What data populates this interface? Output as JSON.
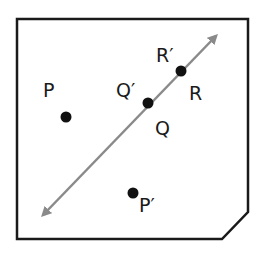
{
  "diagram": {
    "type": "reflection",
    "frame": {
      "stroke": "#1a1a1a"
    },
    "line": {
      "color": "#8a8a8a",
      "from": [
        37,
        221
      ],
      "to": [
        222,
        30
      ]
    },
    "points": [
      {
        "id": "P",
        "label": "P",
        "x": 66,
        "y": 117
      },
      {
        "id": "P_prime",
        "label": "P′",
        "x": 133,
        "y": 193
      },
      {
        "id": "Q",
        "label": "Q",
        "x": 148,
        "y": 103
      },
      {
        "id": "Q_prime",
        "label": "Q′",
        "x": 148,
        "y": 103
      },
      {
        "id": "R",
        "label": "R",
        "x": 181,
        "y": 71
      },
      {
        "id": "R_prime",
        "label": "R′",
        "x": 181,
        "y": 71
      }
    ],
    "labels": {
      "P": "P",
      "P_prime": "P′",
      "Q": "Q",
      "Q_prime": "Q′",
      "R": "R",
      "R_prime": "R′"
    }
  }
}
